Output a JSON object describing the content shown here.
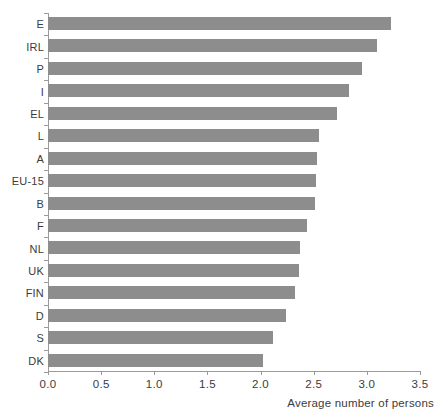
{
  "chart_data": {
    "type": "bar",
    "orientation": "horizontal",
    "title": "",
    "xlabel": "Average number of persons",
    "ylabel": "",
    "xlim": [
      0.0,
      3.5
    ],
    "xticks": [
      "0.0",
      "0.5",
      "1.0",
      "1.5",
      "2.0",
      "2.5",
      "3.0",
      "3.5"
    ],
    "xtick_values": [
      0.0,
      0.5,
      1.0,
      1.5,
      2.0,
      2.5,
      3.0,
      3.5
    ],
    "grid": false,
    "legend": null,
    "bar_color": "#8d8d8d",
    "axis_color": "#9a9a9a",
    "text_color": "#3b3b3b",
    "categories": [
      "E",
      "IRL",
      "P",
      "I",
      "EL",
      "L",
      "A",
      "EU-15",
      "B",
      "F",
      "NL",
      "UK",
      "FIN",
      "D",
      "S",
      "DK"
    ],
    "values": [
      3.23,
      3.1,
      2.95,
      2.83,
      2.72,
      2.55,
      2.53,
      2.52,
      2.51,
      2.44,
      2.37,
      2.36,
      2.32,
      2.24,
      2.12,
      2.02
    ]
  }
}
